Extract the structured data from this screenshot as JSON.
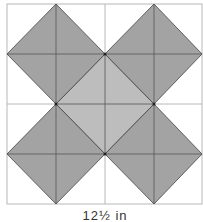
{
  "diagram": {
    "size_label": "12½ in",
    "colors": {
      "background": "#ffffff",
      "grid": "#b8b8b8",
      "dark_fill": "#a3a3a3",
      "light_fill": "#bdbdbd",
      "outline": "#444444"
    },
    "grid": {
      "rows": 4,
      "cols": 4
    },
    "pieces": [
      {
        "name": "top-left-diamond",
        "shade": "dark"
      },
      {
        "name": "top-right-diamond",
        "shade": "dark"
      },
      {
        "name": "bottom-left-diamond",
        "shade": "dark"
      },
      {
        "name": "bottom-right-diamond",
        "shade": "dark"
      },
      {
        "name": "center-diamond",
        "shade": "light"
      }
    ]
  }
}
